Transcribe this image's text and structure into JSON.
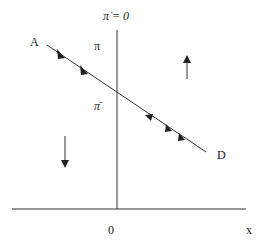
{
  "diagram": {
    "vertical_locus_label": "π̇ = 0",
    "y_label_pi": "π",
    "y_label_pibar": "π̄",
    "x_axis_label": "x",
    "origin_label": "0",
    "saddle_start_label": "A",
    "saddle_end_label": "D",
    "colors": {
      "ink": "#222222",
      "background": "#ffffff"
    },
    "arrows": [
      {
        "name": "upward-motion-arrow",
        "region": "right of locus",
        "direction": "up"
      },
      {
        "name": "downward-motion-arrow",
        "region": "left of locus",
        "direction": "down"
      }
    ],
    "saddle_path_arrows": [
      {
        "side": "A",
        "direction": "toward-equilibrium",
        "count": 2
      },
      {
        "side": "D",
        "direction": "toward-equilibrium",
        "count": 3
      }
    ]
  }
}
